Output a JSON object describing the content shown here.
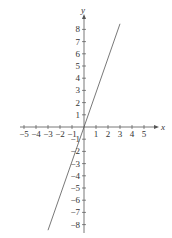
{
  "chart_data": {
    "type": "line",
    "title": "",
    "xlabel": "x",
    "ylabel": "y",
    "xlim": [
      -5,
      5
    ],
    "ylim": [
      -8,
      8
    ],
    "x_ticks": [
      -5,
      -4,
      -3,
      -2,
      -1,
      1,
      2,
      3,
      4,
      5
    ],
    "y_ticks": [
      8,
      7,
      6,
      5,
      4,
      3,
      2,
      1,
      -1,
      -2,
      -3,
      -4,
      -5,
      -6,
      -7,
      -8
    ],
    "grid": false,
    "series": [
      {
        "name": "y = 3x",
        "x": [
          -3,
          3
        ],
        "values": [
          -9,
          9
        ],
        "color": "#555555"
      }
    ]
  },
  "axes": {
    "x_label": "x",
    "y_label": "y",
    "x_tick_labels": [
      "−5",
      "−4",
      "−3",
      "−2",
      "−1",
      "1",
      "2",
      "3",
      "4",
      "5"
    ],
    "y_tick_labels": [
      "8",
      "7",
      "6",
      "5",
      "4",
      "3",
      "2",
      "1",
      "−1",
      "−2",
      "−3",
      "−4",
      "−5",
      "−6",
      "−7",
      "−8"
    ]
  }
}
